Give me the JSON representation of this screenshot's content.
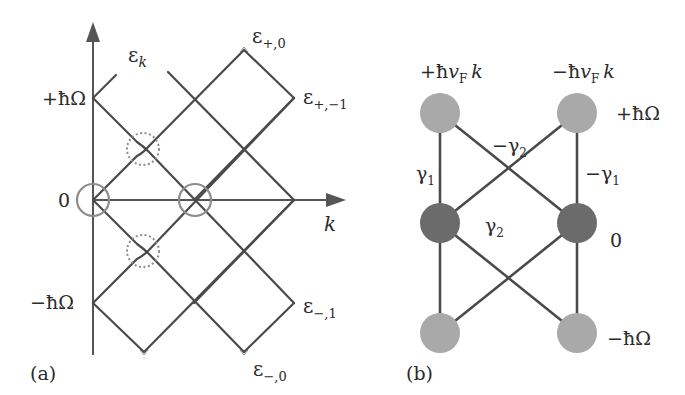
{
  "panel_a": {
    "tag": "(a)",
    "y_axis_label": "ε",
    "y_axis_label_sub": "k",
    "x_axis_label": "k",
    "levels": {
      "plus": "+ħΩ",
      "zero": "0",
      "minus": "−ħΩ"
    },
    "band_labels": {
      "plus_0": {
        "base": "ε",
        "sub": "+,0"
      },
      "plus_m1": {
        "base": "ε",
        "sub": "+,−1"
      },
      "minus_1": {
        "base": "ε",
        "sub": "−,1"
      },
      "minus_0": {
        "base": "ε",
        "sub": "−,0"
      }
    },
    "colors": {
      "lines": "#4a4a4a",
      "axis": "#555555",
      "circles": "#8c8c8c"
    }
  },
  "panel_b": {
    "tag": "(b)",
    "column_labels": {
      "left": {
        "sign": "+ħ",
        "v": "v",
        "sub": "F",
        "k": "k"
      },
      "right": {
        "sign": "−ħ",
        "v": "v",
        "sub": "F",
        "k": "k"
      }
    },
    "row_labels": {
      "top": "+ħΩ",
      "middle": "0",
      "bottom": "−ħΩ"
    },
    "couplings": {
      "left_vertical": {
        "base": "γ",
        "sub": "1"
      },
      "right_vertical": {
        "base": "−γ",
        "sub": "1"
      },
      "top_cross": {
        "base": "−γ",
        "sub": "2"
      },
      "bottom_cross": {
        "base": "γ",
        "sub": "2"
      }
    },
    "colors": {
      "outer_nodes": "#a9a9a9",
      "middle_nodes": "#6b6b6b",
      "edges": "#4a4a4a"
    }
  }
}
